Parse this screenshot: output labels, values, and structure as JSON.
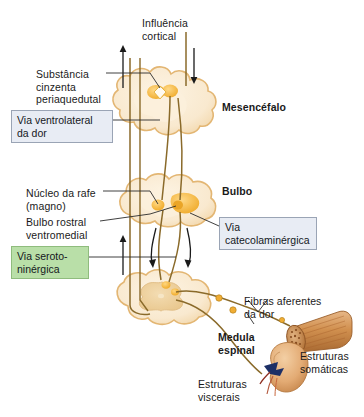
{
  "figure": {
    "language": "pt-BR",
    "background": "#ffffff"
  },
  "labels": {
    "influencia_cortical": "Influência\ncortical",
    "substancia_cinzenta": "Substância\ncinzenta\nperiaquedutal",
    "mesencefalo": "Mesencéfalo",
    "nucleo_rafe": "Núcleo da rafe\n(magno)",
    "bulbo": "Bulbo",
    "bulbo_rostral": "Bulbo rostral\nventromedial",
    "fibras_aferentes": "Fibras aferentes\nda dor",
    "medula_espinal": "Medula\nespinal",
    "estruturas_somaticas": "Estruturas\nsomáticas",
    "estruturas_viscerais": "Estruturas\nviscerais"
  },
  "callouts": {
    "ventrolateral": {
      "text": "Via ventrolateral\nda dor",
      "fill": "#e8ecf4",
      "border": "#9aa4b5"
    },
    "catecolaminergica": {
      "text": "Via\ncatecolaminérgica",
      "fill": "#e8ecf4",
      "border": "#9aa4b5"
    },
    "serotoninergica": {
      "text": "Via seroto-\nninérgica",
      "fill": "#b9dfa8",
      "border": "#8fbc7d"
    }
  },
  "colors": {
    "tissue_fill": "#f7e4c3",
    "tissue_fill_light": "#fbf1dd",
    "tissue_stroke": "#e8b96b",
    "gray_matter": "#f0d4a4",
    "nucleus_orange": "#f0ad34",
    "nucleus_orange_light": "#f7c96a",
    "tract_line": "#8a6a2a",
    "muscle_fill": "#d99c5e",
    "muscle_dark": "#a8622c",
    "organ_fill": "#e8b381",
    "organ_vessel": "#1c2f66",
    "leader_line": "#2a2a2a",
    "text": "#1a1a1a"
  },
  "structures": {
    "midbrain": {
      "name": "Mesencéfalo",
      "nuclei": [
        "periaqueductal-gray"
      ]
    },
    "medulla": {
      "name": "Bulbo",
      "nuclei": [
        "nucleus-raphe-magnus",
        "rostral-ventromedial-medulla"
      ]
    },
    "spinal_cord": {
      "name": "Medula espinal",
      "nuclei": [
        "dorsal-horn"
      ]
    },
    "somatic": {
      "name": "Estruturas somáticas",
      "depicts": "muscle-bundle"
    },
    "visceral": {
      "name": "Estruturas viscerais",
      "depicts": "kidney-organ"
    }
  },
  "pathways": [
    {
      "name": "Via ventrolateral da dor",
      "direction": "ascending",
      "arrow": "up"
    },
    {
      "name": "Influência cortical",
      "direction": "descending",
      "arrow": "down"
    },
    {
      "name": "Via serotoninérgica",
      "direction": "descending",
      "arrow": "down"
    },
    {
      "name": "Via catecolaminérgica",
      "direction": "descending",
      "arrow": "down"
    }
  ]
}
